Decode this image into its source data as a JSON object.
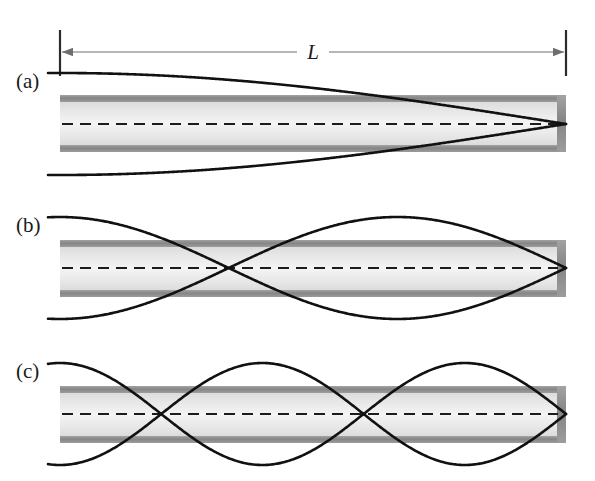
{
  "figure": {
    "background_color": "#ffffff",
    "width": 595,
    "height": 481,
    "dimension": {
      "label": "L",
      "name": "tube-length",
      "x_start": 60,
      "x_end": 566,
      "y": 52,
      "tick_top": 30,
      "tick_bottom": 76,
      "line_color": "#6e6e6e",
      "tick_color": "#2b2b2b",
      "label_x": 313,
      "label_y": 59
    },
    "tube_style": {
      "wall_color": "#8c8c8c",
      "wall_thickness": 7,
      "interior_top_color": "#e2e2e2",
      "interior_mid_color": "#f2f2f2",
      "interior_bottom_color": "#e2e2e2",
      "center_line_color": "#1c1c1c",
      "curve_color": "#111111",
      "curve_width": 2.6,
      "open_end": "left",
      "closed_end": "right",
      "x_left": 60,
      "x_right": 566,
      "end_cap_width": 9
    },
    "panels": [
      {
        "id": "a",
        "label": "(a)",
        "label_x": 16,
        "label_y": 88,
        "harmonic": 1,
        "harmonic_name": "fundamental",
        "wavelength_fraction_of_L": 4,
        "nodes_interior": 0,
        "node_positions_x": [
          566
        ],
        "antinode_positions_x": [
          60
        ],
        "tube_top": 95,
        "tube_bottom": 152,
        "center_y": 124,
        "amplitude": 51,
        "wave_x_start": 48,
        "wave_x_end": 566
      },
      {
        "id": "b",
        "label": "(b)",
        "label_x": 16,
        "label_y": 232,
        "harmonic": 3,
        "harmonic_name": "third harmonic",
        "wavelength_fraction_of_L": 1.3333,
        "nodes_interior": 1,
        "node_positions_x": [
          228,
          566
        ],
        "antinode_positions_x": [
          60,
          397
        ],
        "tube_top": 240,
        "tube_bottom": 297,
        "center_y": 268,
        "amplitude": 51,
        "wave_x_start": 48,
        "wave_x_end": 566
      },
      {
        "id": "c",
        "label": "(c)",
        "label_x": 16,
        "label_y": 378,
        "harmonic": 5,
        "harmonic_name": "fifth harmonic",
        "wavelength_fraction_of_L": 0.8,
        "nodes_interior": 2,
        "node_positions_x": [
          161,
          363,
          566
        ],
        "antinode_positions_x": [
          60,
          262,
          464
        ],
        "tube_top": 386,
        "tube_bottom": 443,
        "center_y": 414,
        "amplitude": 51,
        "wave_x_start": 48,
        "wave_x_end": 566
      }
    ]
  }
}
